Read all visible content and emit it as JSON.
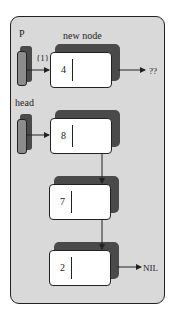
{
  "diagram": {
    "type": "linked-list-insertion",
    "labels": {
      "p": "P",
      "new_node": "new node",
      "step": "{1}",
      "head": "head",
      "unknown_next": "??",
      "nil": "NIL"
    },
    "pointers": [
      {
        "name": "P",
        "points_to": "new node (4)"
      },
      {
        "name": "head",
        "points_to": "8"
      }
    ],
    "nodes": [
      {
        "value": "4",
        "role": "new node",
        "next": "??"
      },
      {
        "value": "8",
        "role": "head",
        "next": "7"
      },
      {
        "value": "7",
        "next": "2"
      },
      {
        "value": "2",
        "next": "NIL"
      }
    ],
    "colors": {
      "frame_bg": "#d9d9d9",
      "shadow": "#4a4a4a",
      "pointer_fill": "#8c8c8c",
      "node_fill": "#ffffff"
    }
  }
}
